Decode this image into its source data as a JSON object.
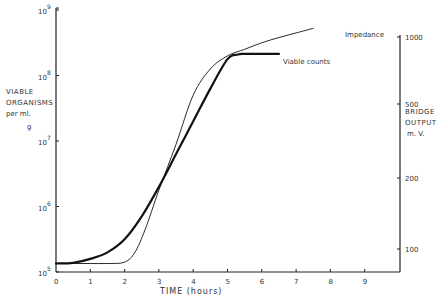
{
  "chart_data": {
    "type": "line",
    "title": "",
    "xlabel": "TIME (hours)",
    "ylabel_left": [
      "VIABLE",
      "ORGANISMS",
      "per ml.",
      "g"
    ],
    "ylabel_right": [
      "BRIDGE",
      "OUTPUT",
      "m. V."
    ],
    "x_ticks": [
      "0",
      "1",
      "2",
      "3",
      "4",
      "5",
      "6",
      "7",
      "8",
      "9"
    ],
    "xlim": [
      0,
      10
    ],
    "y_left_scale": "log",
    "y_left_ticks": [
      {
        "base": "10",
        "exp": "5"
      },
      {
        "base": "10",
        "exp": "6"
      },
      {
        "base": "10",
        "exp": "7"
      },
      {
        "base": "10",
        "exp": "8"
      },
      {
        "base": "10",
        "exp": "9"
      }
    ],
    "ylim_left": [
      100000,
      1000000000
    ],
    "y_right_ticks": [
      "1000",
      "500",
      "200",
      "100"
    ],
    "series": [
      {
        "name": "Viable counts",
        "style": "thick",
        "x": [
          0,
          0.5,
          1,
          1.5,
          2,
          2.5,
          3,
          3.5,
          4,
          4.5,
          5,
          5.3,
          5.5,
          6,
          6.5
        ],
        "y_log10": [
          5.13,
          5.14,
          5.2,
          5.3,
          5.5,
          5.85,
          6.3,
          6.8,
          7.3,
          7.8,
          8.25,
          8.32,
          8.33,
          8.33,
          8.33
        ]
      },
      {
        "name": "Impedance",
        "style": "thin",
        "x": [
          0,
          0.5,
          1,
          1.5,
          2,
          2.3,
          2.6,
          3,
          3.5,
          4,
          4.5,
          5,
          5.5,
          6,
          6.5,
          7,
          7.5
        ],
        "y_log10": [
          5.13,
          5.13,
          5.13,
          5.13,
          5.15,
          5.3,
          5.65,
          6.25,
          6.95,
          7.7,
          8.1,
          8.3,
          8.4,
          8.5,
          8.58,
          8.65,
          8.72
        ]
      }
    ],
    "legend": [
      {
        "label": "Impedance",
        "position": "end of thin curve"
      },
      {
        "label": "Viable counts",
        "position": "end of thick curve"
      }
    ],
    "grid": false
  }
}
